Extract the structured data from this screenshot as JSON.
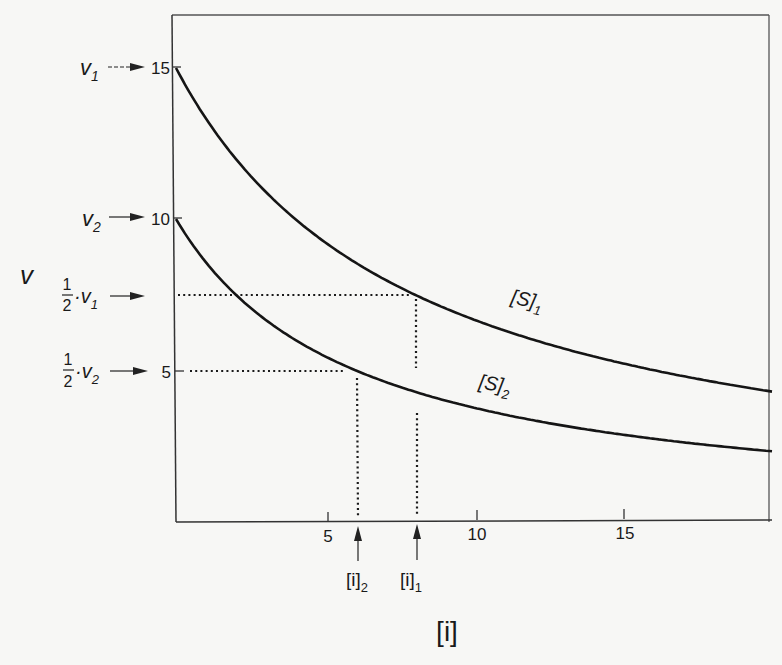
{
  "chart_data": {
    "type": "line",
    "title": "",
    "xlabel": "[i]",
    "ylabel": "v",
    "xlim": [
      0,
      20
    ],
    "ylim": [
      0,
      16.5
    ],
    "x_ticks": [
      5,
      10,
      15
    ],
    "y_ticks": [
      5,
      10,
      15
    ],
    "grid": false,
    "legend": "inline curve labels",
    "series": [
      {
        "name": "[S]1",
        "label_main": "[S]",
        "label_sub": "1",
        "v0": 15,
        "half_point_x": 8,
        "x": [
          0,
          2,
          4,
          6,
          8,
          10,
          12,
          14,
          16,
          18,
          20
        ],
        "values": [
          15,
          12,
          10,
          8.57,
          7.5,
          6.67,
          6.0,
          5.45,
          5.0,
          4.62,
          4.29
        ]
      },
      {
        "name": "[S]2",
        "label_main": "[S]",
        "label_sub": "2",
        "v0": 10,
        "half_point_x": 6,
        "x": [
          0,
          2,
          4,
          6,
          8,
          10,
          12,
          14,
          16,
          18,
          20
        ],
        "values": [
          10,
          7.5,
          6.0,
          5.0,
          4.29,
          3.75,
          3.33,
          3.0,
          2.73,
          2.5,
          2.31
        ]
      }
    ],
    "annotations": {
      "y_left": [
        {
          "main": "v",
          "sub": "1",
          "value": 15
        },
        {
          "main": "v",
          "sub": "2",
          "value": 10
        },
        {
          "frac_num": "1",
          "frac_den": "2",
          "main": "·v",
          "sub": "1",
          "value": 7.5
        },
        {
          "frac_num": "1",
          "frac_den": "2",
          "main": "·v",
          "sub": "2",
          "value": 5
        }
      ],
      "x_bottom": [
        {
          "main": "[i]",
          "sub": "2",
          "value": 6
        },
        {
          "main": "[i]",
          "sub": "1",
          "value": 8
        }
      ]
    }
  },
  "labels": {
    "y_axis": "v",
    "x_axis": "[i]",
    "tick_5_x": "5",
    "tick_10_x": "10",
    "tick_15_x": "15",
    "tick_15_y": "15",
    "tick_10_y": "10",
    "tick_5_y": "5",
    "v1_main": "v",
    "v1_sub": "1",
    "v2_main": "v",
    "v2_sub": "2",
    "half_num": "1",
    "half_den": "2",
    "half_v1_main": "·v",
    "half_v1_sub": "1",
    "half_v2_main": "·v",
    "half_v2_sub": "2",
    "s1_main": "[S]",
    "s1_sub": "1",
    "s2_main": "[S]",
    "s2_sub": "2",
    "i2_main": "[i]",
    "i2_sub": "2",
    "i1_main": "[i]",
    "i1_sub": "1"
  },
  "colors": {
    "ink": "#1a1a1a",
    "paper": "#f7f7f5"
  }
}
